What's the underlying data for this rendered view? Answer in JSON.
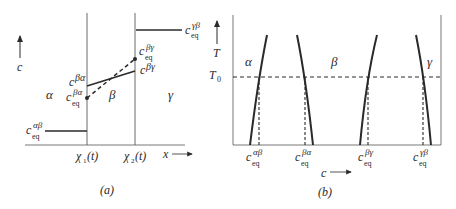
{
  "panel_a": {
    "caption": "(a)",
    "y_axis_label": "c",
    "x_axis_label": "x",
    "interface_labels": [
      "χ1(t)",
      "χ2(t)"
    ],
    "interface_1": {
      "base": "χ",
      "sub": "1",
      "tail": "(t)"
    },
    "interface_2": {
      "base": "χ",
      "sub": "2",
      "tail": "(t)"
    },
    "phase_labels": {
      "alpha": "α",
      "beta": "β",
      "gamma": "γ"
    },
    "concentration_labels": {
      "ceq_alpha_beta": {
        "base": "c",
        "sup": "αβ",
        "sub": "eq"
      },
      "c_beta_alpha": {
        "base": "c",
        "sup": "βα"
      },
      "ceq_beta_alpha": {
        "base": "c",
        "sup": "βα",
        "sub": "eq"
      },
      "c_beta_gamma": {
        "base": "c",
        "sup": "βγ"
      },
      "ceq_beta_gamma": {
        "base": "c",
        "sup": "βγ",
        "sub": "eq"
      },
      "ceq_gamma_beta": {
        "base": "c",
        "sup": "γβ",
        "sub": "eq"
      }
    },
    "line_styles": {
      "actual_profile": "solid",
      "equilibrium_profile": "dashed"
    }
  },
  "panel_b": {
    "caption": "(b)",
    "y_axis_label": "T",
    "x_axis_label": "c",
    "reference_temperature": {
      "base": "T",
      "sub": "0"
    },
    "phase_labels": {
      "alpha": "α",
      "beta": "β",
      "gamma": "γ"
    },
    "boundary_labels": [
      {
        "base": "c",
        "sup": "αβ",
        "sub": "eq"
      },
      {
        "base": "c",
        "sup": "βα",
        "sub": "eq"
      },
      {
        "base": "c",
        "sup": "βγ",
        "sub": "eq"
      },
      {
        "base": "c",
        "sup": "γβ",
        "sub": "eq"
      }
    ]
  },
  "colors": {
    "ink": "#2a2a2a",
    "background": "#ffffff"
  }
}
